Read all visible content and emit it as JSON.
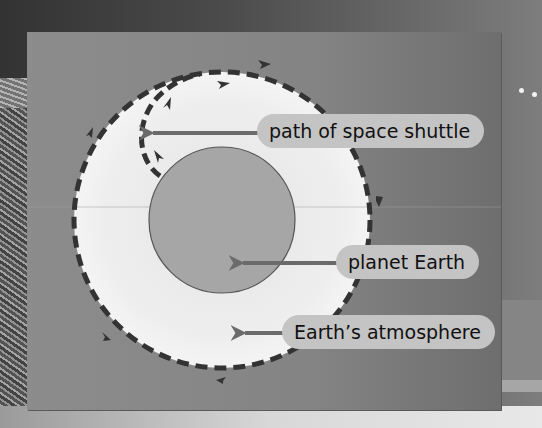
{
  "diagram": {
    "labels": {
      "shuttle_path": "path of space shuttle",
      "planet": "planet Earth",
      "atmosphere": "Earth’s atmosphere"
    },
    "colors": {
      "frame_bg": "#888888",
      "atmosphere_fill": "#ececec",
      "planet_fill": "#a6a6a6",
      "dash_stroke": "#333333",
      "arrow_color": "#6b6b6b",
      "label_bg": "#c4c4c4"
    },
    "icons": [
      "orbit-direction-arrowhead",
      "pointer-arrow",
      "star-dot"
    ]
  }
}
